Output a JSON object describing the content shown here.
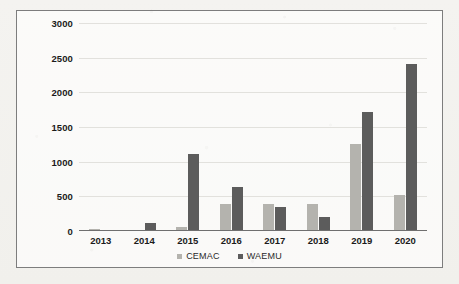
{
  "chart_data": {
    "type": "bar",
    "title": "",
    "xlabel": "",
    "ylabel": "",
    "ylim": [
      0,
      3000
    ],
    "ytick_step": 500,
    "yticks": [
      "3000",
      "2500",
      "2000",
      "1500",
      "1000",
      "500",
      "0"
    ],
    "ytick_values": [
      3000,
      2500,
      2000,
      1500,
      1000,
      500,
      0
    ],
    "grid": true,
    "legend_position": "bottom",
    "categories": [
      "2013",
      "2014",
      "2015",
      "2016",
      "2017",
      "2018",
      "2019",
      "2020"
    ],
    "series": [
      {
        "name": "CEMAC",
        "color": "#b4b3ae",
        "values": [
          20,
          0,
          40,
          380,
          380,
          370,
          1240,
          510
        ]
      },
      {
        "name": "WAEMU",
        "color": "#5c5c5c",
        "values": [
          0,
          100,
          1100,
          620,
          330,
          190,
          1700,
          2400
        ]
      }
    ]
  },
  "legend": {
    "items": [
      {
        "label": "CEMAC",
        "swatch": "cemac"
      },
      {
        "label": "WAEMU",
        "swatch": "waemu"
      }
    ]
  }
}
